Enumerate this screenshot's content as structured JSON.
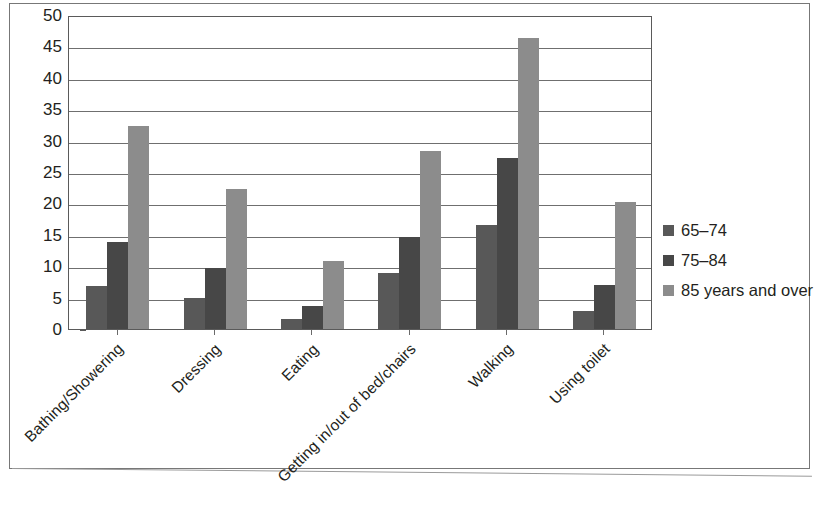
{
  "chart_data": {
    "type": "bar",
    "title": "",
    "subtitle": "",
    "xlabel": "",
    "ylabel": "",
    "ylim": [
      0,
      50
    ],
    "ytick_step": 5,
    "yticks": [
      50,
      45,
      40,
      35,
      30,
      25,
      20,
      15,
      10,
      5,
      0
    ],
    "grid": true,
    "grid_axis": "y",
    "legend_position": "right",
    "orientation": "vertical",
    "grouping": "grouped",
    "categories": [
      "Bathing/Showering",
      "Dressing",
      "Eating",
      "Getting in/out of bed/chairs",
      "Walking",
      "Using toilet"
    ],
    "series": [
      {
        "name": "65–74",
        "color": "#585858",
        "values": [
          6.8,
          5.0,
          1.6,
          8.9,
          16.5,
          2.9
        ]
      },
      {
        "name": "75–84",
        "color": "#474747",
        "values": [
          13.9,
          9.7,
          3.7,
          14.7,
          27.2,
          7.0
        ]
      },
      {
        "name": "85 years and over",
        "color": "#8c8c8c",
        "values": [
          32.3,
          22.3,
          10.9,
          28.4,
          46.3,
          20.3
        ]
      }
    ]
  },
  "legend": {
    "items": [
      {
        "label": "65–74",
        "color": "#585858"
      },
      {
        "label": "75–84",
        "color": "#474747"
      },
      {
        "label": "85 years and over",
        "color": "#8c8c8c"
      }
    ]
  },
  "colors": {
    "series_65_74": "#585858",
    "series_75_84": "#474747",
    "series_85_over": "#8c8c8c",
    "axis": "#5a5a5a",
    "gridline": "#6f6f6f",
    "text": "#231f20",
    "page_border": "#777777",
    "background": "#ffffff"
  }
}
